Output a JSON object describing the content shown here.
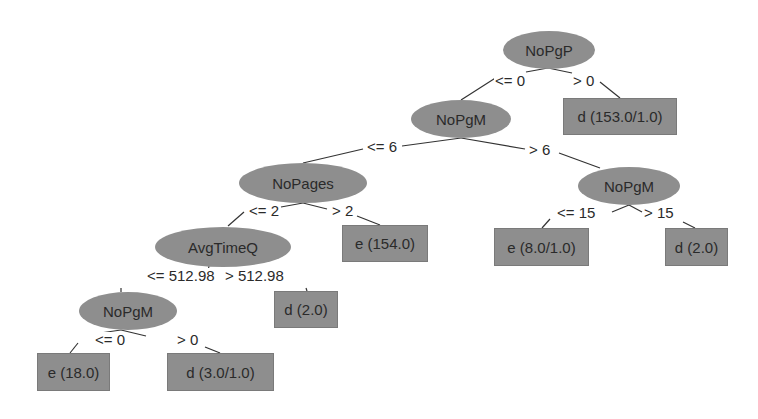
{
  "diagram": {
    "type": "decision-tree",
    "colors": {
      "node_fill": "#8e8e8e",
      "edge": "#333333",
      "text": "#2a2a2a",
      "background": "#ffffff"
    },
    "nodes": {
      "root": {
        "label": "NoPgP",
        "kind": "split"
      },
      "leaf_root_gt0": {
        "label": "d (153.0/1.0)",
        "kind": "leaf"
      },
      "nopgm_l2": {
        "label": "NoPgM",
        "kind": "split"
      },
      "nopages": {
        "label": "NoPages",
        "kind": "split"
      },
      "nopgm_right": {
        "label": "NoPgM",
        "kind": "split"
      },
      "avgtimeq": {
        "label": "AvgTimeQ",
        "kind": "split"
      },
      "leaf_nopages_gt2": {
        "label": "e (154.0)",
        "kind": "leaf"
      },
      "leaf_nopgm_right_le15": {
        "label": "e (8.0/1.0)",
        "kind": "leaf"
      },
      "leaf_nopgm_right_gt15": {
        "label": "d (2.0)",
        "kind": "leaf"
      },
      "leaf_avgtimeq_gt": {
        "label": "d (2.0)",
        "kind": "leaf"
      },
      "nopgm_bottom": {
        "label": "NoPgM",
        "kind": "split"
      },
      "leaf_nopgm_bottom_le0": {
        "label": "e (18.0)",
        "kind": "leaf"
      },
      "leaf_nopgm_bottom_gt0": {
        "label": "d (3.0/1.0)",
        "kind": "leaf"
      }
    },
    "edges": {
      "root_le0": {
        "from": "root",
        "to": "nopgm_l2",
        "label": "<= 0"
      },
      "root_gt0": {
        "from": "root",
        "to": "leaf_root_gt0",
        "label": "> 0"
      },
      "nopgm_l2_le6": {
        "from": "nopgm_l2",
        "to": "nopages",
        "label": "<= 6"
      },
      "nopgm_l2_gt6": {
        "from": "nopgm_l2",
        "to": "nopgm_right",
        "label": "> 6"
      },
      "nopages_le2": {
        "from": "nopages",
        "to": "avgtimeq",
        "label": "<= 2"
      },
      "nopages_gt2": {
        "from": "nopages",
        "to": "leaf_nopages_gt2",
        "label": "> 2"
      },
      "nopgm_right_le15": {
        "from": "nopgm_right",
        "to": "leaf_nopgm_right_le15",
        "label": "<= 15"
      },
      "nopgm_right_gt15": {
        "from": "nopgm_right",
        "to": "leaf_nopgm_right_gt15",
        "label": "> 15"
      },
      "avgtimeq_le": {
        "from": "avgtimeq",
        "to": "nopgm_bottom",
        "label": "<= 512.98"
      },
      "avgtimeq_gt": {
        "from": "avgtimeq",
        "to": "leaf_avgtimeq_gt",
        "label": "> 512.98"
      },
      "nopgm_bottom_le0": {
        "from": "nopgm_bottom",
        "to": "leaf_nopgm_bottom_le0",
        "label": "<= 0"
      },
      "nopgm_bottom_gt0": {
        "from": "nopgm_bottom",
        "to": "leaf_nopgm_bottom_gt0",
        "label": "> 0"
      }
    }
  }
}
